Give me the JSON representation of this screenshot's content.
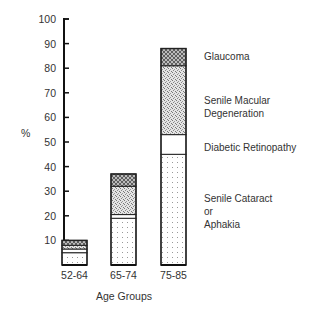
{
  "chart_data": {
    "type": "bar",
    "stacked": true,
    "title": "",
    "xlabel": "Age Groups",
    "ylabel": "%",
    "ylim": [
      0,
      100
    ],
    "yticks": [
      10,
      20,
      30,
      40,
      50,
      60,
      70,
      80,
      90,
      100
    ],
    "grid": false,
    "legend_position": "right (labels aligned with segments of last bar)",
    "categories": [
      "52-64",
      "65-74",
      "75-85"
    ],
    "series": [
      {
        "name": "Senile Cataract or Aphakia",
        "pattern": "sparse-dots",
        "values": [
          5,
          19,
          45
        ]
      },
      {
        "name": "Diabetic Retinopathy",
        "pattern": "blank",
        "values": [
          1.5,
          1.5,
          8
        ]
      },
      {
        "name": "Senile Macular Degeneration",
        "pattern": "dense-stipple",
        "values": [
          1.5,
          11.5,
          28
        ]
      },
      {
        "name": "Glaucoma",
        "pattern": "crosshatch",
        "values": [
          2,
          5,
          7
        ]
      }
    ],
    "totals": [
      10,
      37,
      88
    ]
  },
  "axis": {
    "y_label": "%",
    "x_label": "Age Groups",
    "y_tick_labels": [
      "10",
      "20",
      "30",
      "40",
      "50",
      "60",
      "70",
      "80",
      "90",
      "100"
    ]
  },
  "legend": {
    "glaucoma": "Glaucoma",
    "smd_line1": "Senile Macular",
    "smd_line2": "Degeneration",
    "diabetic": "Diabetic Retinopathy",
    "cataract_line1": "Senile Cataract",
    "cataract_line2": "or",
    "cataract_line3": "Aphakia"
  },
  "colors": {
    "axis": "#111111",
    "bar_outline": "#222222",
    "text": "#333333"
  }
}
